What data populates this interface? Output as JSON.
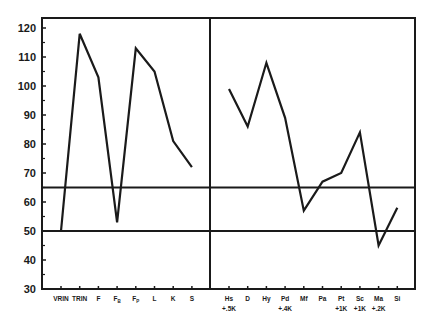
{
  "chart_data": {
    "type": "line",
    "title": "",
    "xlabel": "",
    "ylabel": "",
    "ylim": [
      30,
      122
    ],
    "yticks": [
      30,
      40,
      50,
      60,
      70,
      80,
      90,
      100,
      110,
      120
    ],
    "grid": false,
    "reference_lines": [
      50,
      65
    ],
    "panels": [
      {
        "name": "validity",
        "categories": [
          {
            "label": "VRIN",
            "sub": ""
          },
          {
            "label": "TRIN",
            "sub": ""
          },
          {
            "label": "F",
            "sub": ""
          },
          {
            "label": "F",
            "subscript": "B",
            "sub": ""
          },
          {
            "label": "F",
            "subscript": "P",
            "sub": ""
          },
          {
            "label": "L",
            "sub": ""
          },
          {
            "label": "K",
            "sub": ""
          },
          {
            "label": "S",
            "sub": ""
          }
        ],
        "values": [
          50,
          118,
          103,
          53,
          113,
          105,
          81,
          72
        ]
      },
      {
        "name": "clinical",
        "categories": [
          {
            "label": "Hs",
            "sub": "+.5K"
          },
          {
            "label": "D",
            "sub": ""
          },
          {
            "label": "Hy",
            "sub": ""
          },
          {
            "label": "Pd",
            "sub": "+.4K"
          },
          {
            "label": "Mf",
            "sub": ""
          },
          {
            "label": "Pa",
            "sub": ""
          },
          {
            "label": "Pt",
            "sub": "+1K"
          },
          {
            "label": "Sc",
            "sub": "+1K"
          },
          {
            "label": "Ma",
            "sub": "+.2K"
          },
          {
            "label": "Si",
            "sub": ""
          }
        ],
        "values": [
          99,
          86,
          108,
          89,
          57,
          67,
          70,
          84,
          45,
          58
        ]
      }
    ]
  },
  "colors": {
    "line": "#1a1a1a",
    "frame": "#1a1a1a",
    "background": "#ffffff"
  }
}
